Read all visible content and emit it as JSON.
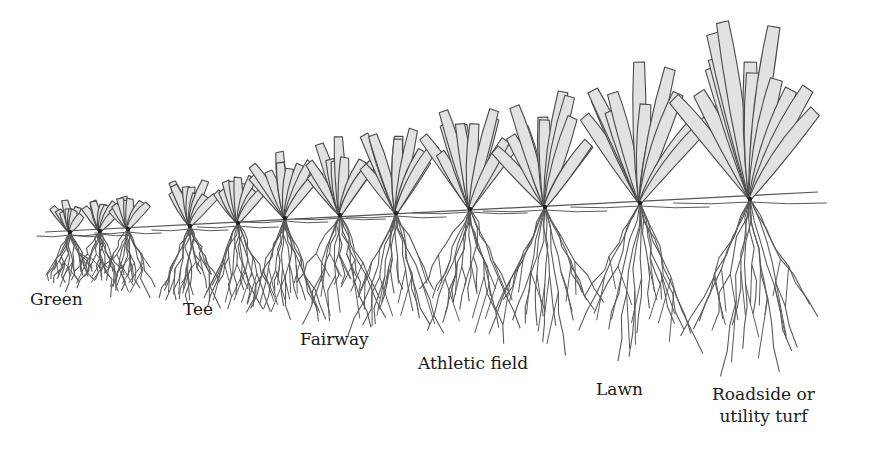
{
  "figure": {
    "type": "turfgrass mowing-height illustration",
    "colors": {
      "blade_fill": "#e2e2e2",
      "blade_stroke": "#4a4a4a",
      "root_stroke": "#5a5a5a",
      "text": "#1a1a1a",
      "background": "#ffffff"
    },
    "soil_line": {
      "x1": 45,
      "y1": 232,
      "x2": 818,
      "y2": 192
    }
  },
  "labels": [
    {
      "id": "green",
      "text": "Green",
      "x": 30,
      "y": 288
    },
    {
      "id": "tee",
      "text": "Tee",
      "x": 183,
      "y": 298
    },
    {
      "id": "fairway",
      "text": "Fairway",
      "x": 300,
      "y": 328
    },
    {
      "id": "athletic",
      "text": "Athletic field",
      "x": 418,
      "y": 352
    },
    {
      "id": "lawn",
      "text": "Lawn",
      "x": 596,
      "y": 378
    },
    {
      "id": "roadside",
      "text": "Roadside or\nutility turf",
      "x": 712,
      "y": 383
    }
  ],
  "plants": [
    {
      "x": 70,
      "y": 232,
      "height": 32,
      "spread": 28,
      "root_depth": 60,
      "blades": 9
    },
    {
      "x": 100,
      "y": 231,
      "height": 34,
      "spread": 26,
      "root_depth": 62,
      "blades": 8
    },
    {
      "x": 128,
      "y": 229,
      "height": 38,
      "spread": 28,
      "root_depth": 66,
      "blades": 8
    },
    {
      "x": 190,
      "y": 226,
      "height": 48,
      "spread": 32,
      "root_depth": 80,
      "blades": 9
    },
    {
      "x": 238,
      "y": 223,
      "height": 54,
      "spread": 34,
      "root_depth": 88,
      "blades": 9
    },
    {
      "x": 285,
      "y": 218,
      "height": 66,
      "spread": 36,
      "root_depth": 100,
      "blades": 9
    },
    {
      "x": 340,
      "y": 215,
      "height": 76,
      "spread": 38,
      "root_depth": 110,
      "blades": 10
    },
    {
      "x": 396,
      "y": 213,
      "height": 86,
      "spread": 42,
      "root_depth": 118,
      "blades": 10
    },
    {
      "x": 470,
      "y": 209,
      "height": 100,
      "spread": 48,
      "root_depth": 130,
      "blades": 11
    },
    {
      "x": 545,
      "y": 207,
      "height": 118,
      "spread": 52,
      "root_depth": 142,
      "blades": 11
    },
    {
      "x": 640,
      "y": 203,
      "height": 140,
      "spread": 58,
      "root_depth": 155,
      "blades": 12
    },
    {
      "x": 750,
      "y": 199,
      "height": 175,
      "spread": 64,
      "root_depth": 170,
      "blades": 13
    }
  ]
}
